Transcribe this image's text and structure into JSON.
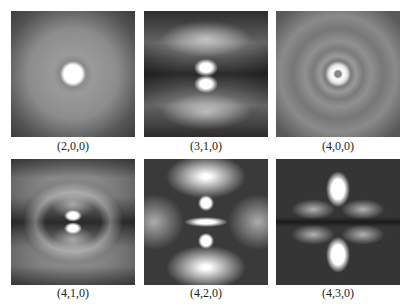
{
  "figure": {
    "panels": [
      {
        "label": "(2,0,0)"
      },
      {
        "label": "(3,1,0)"
      },
      {
        "label": "(4,0,0)"
      },
      {
        "label": "(4,1,0)"
      },
      {
        "label": "(4,2,0)"
      },
      {
        "label": "(4,3,0)"
      }
    ]
  }
}
